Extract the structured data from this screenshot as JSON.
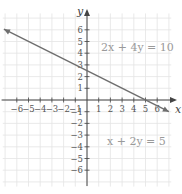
{
  "chart_data": {
    "type": "line",
    "title": "",
    "xlabel": "x",
    "ylabel": "y",
    "xlim": [
      -7,
      7
    ],
    "ylim": [
      -7,
      7
    ],
    "grid": true,
    "x_ticks": [
      -6,
      -5,
      -4,
      -3,
      -2,
      -1,
      1,
      2,
      3,
      4,
      5,
      6
    ],
    "y_ticks": [
      -6,
      -5,
      -4,
      -3,
      -2,
      -1,
      1,
      2,
      3,
      4,
      5,
      6
    ],
    "series": [
      {
        "name": "2x + 4y = 10 / x + 2y = 5",
        "equation": "y = -0.5x + 2.5",
        "x": [
          -7,
          7
        ],
        "y": [
          6,
          -1
        ],
        "arrows": "both"
      }
    ],
    "annotations": [
      {
        "text": "2x + 4y = 10",
        "x": 3.5,
        "y": 4.2
      },
      {
        "text": "x + 2y = 5",
        "x": 3.5,
        "y": -3.5
      }
    ],
    "line_color": "#6e6e6e"
  },
  "labels": {
    "x_axis": "x",
    "y_axis": "y",
    "eq1": "2x + 4y = 10",
    "eq2": "x + 2y = 5"
  }
}
